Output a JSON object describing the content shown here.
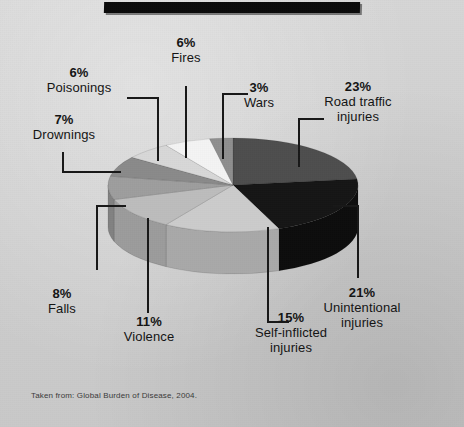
{
  "caption": "Taken from: Global Burden of Disease, 2004.",
  "colors": {
    "background": "#d2d2d2",
    "topbar": "#0b0b0b",
    "text": "#141414",
    "leader": "#181818"
  },
  "chart_data": {
    "type": "pie",
    "title": "",
    "subtitle": "",
    "xlabel": "",
    "ylabel": "",
    "legend_position": "callout-labels",
    "grid": false,
    "units": "percent",
    "total": 100,
    "source_note": "Taken from: Global Burden of Disease, 2004.",
    "categories": [
      "Road traffic injuries",
      "Unintentional injuries",
      "Self-inflicted injuries",
      "Violence",
      "Falls",
      "Drownings",
      "Poisonings",
      "Fires",
      "Wars"
    ],
    "values": [
      23,
      21,
      15,
      11,
      8,
      7,
      6,
      6,
      3
    ],
    "slices": [
      {
        "label": "Road traffic injuries",
        "pct": "23%",
        "value": 23,
        "color": "#4e4e4e",
        "side": "#3b3b3b"
      },
      {
        "label": "Unintentional injuries",
        "pct": "21%",
        "value": 21,
        "color": "#161616",
        "side": "#0d0d0d"
      },
      {
        "label": "Self-inflicted injuries",
        "pct": "15%",
        "value": 15,
        "color": "#cccccc",
        "side": "#a9a9a9"
      },
      {
        "label": "Violence",
        "pct": "11%",
        "value": 11,
        "color": "#bdbdbd",
        "side": "#9c9c9c"
      },
      {
        "label": "Falls",
        "pct": "8%",
        "value": 8,
        "color": "#9e9e9e",
        "side": "#828282"
      },
      {
        "label": "Drownings",
        "pct": "7%",
        "value": 7,
        "color": "#8a8a8a",
        "side": "#6f6f6f"
      },
      {
        "label": "Poisonings",
        "pct": "6%",
        "value": 6,
        "color": "#d8d8d8",
        "side": "#b2b2b2"
      },
      {
        "label": "Fires",
        "pct": "6%",
        "value": 6,
        "color": "#f4f4f4",
        "side": "#cfcfcf"
      },
      {
        "label": "Wars",
        "pct": "3%",
        "value": 3,
        "color": "#8f8f8f",
        "side": "#737373"
      }
    ]
  },
  "labels": {
    "fires": {
      "pct": "6%",
      "name": "Fires"
    },
    "poisonings": {
      "pct": "6%",
      "name": "Poisonings"
    },
    "drownings": {
      "pct": "7%",
      "name": "Drownings"
    },
    "wars": {
      "pct": "3%",
      "name": "Wars"
    },
    "road": {
      "pct": "23%",
      "name_line1": "Road traffic",
      "name_line2": "injuries"
    },
    "unintentional": {
      "pct": "21%",
      "name_line1": "Unintentional",
      "name_line2": "injuries"
    },
    "selfinflicted": {
      "pct": "15%",
      "name_line1": "Self-inflicted",
      "name_line2": "injuries"
    },
    "violence": {
      "pct": "11%",
      "name": "Violence"
    },
    "falls": {
      "pct": "8%",
      "name": "Falls"
    }
  }
}
